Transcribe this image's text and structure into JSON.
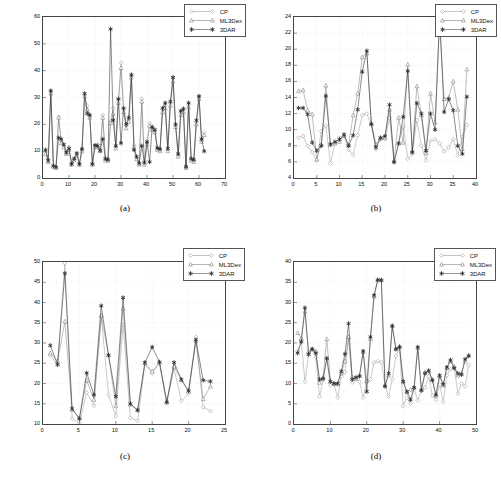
{
  "figure": {
    "panels": [
      {
        "id": "a",
        "caption": "(a)",
        "legend": [
          {
            "label": "CP",
            "marker": "diamond-open"
          },
          {
            "label": "ML3Dex",
            "marker": "triangle-open"
          },
          {
            "label": "3DAR",
            "marker": "star-filled"
          }
        ],
        "chart_data": {
          "type": "line",
          "title": "",
          "xlabel": "",
          "ylabel": "",
          "xlim": [
            0,
            70
          ],
          "ylim": [
            0,
            60
          ],
          "xticks": [
            0,
            10,
            20,
            30,
            40,
            50,
            60,
            70
          ],
          "yticks": [
            0,
            10,
            20,
            30,
            40,
            50,
            60
          ],
          "grid": true,
          "legend_position": "top-right",
          "x": [
            1,
            2,
            3,
            4,
            5,
            6,
            7,
            8,
            9,
            10,
            11,
            12,
            13,
            14,
            15,
            16,
            17,
            18,
            19,
            20,
            21,
            22,
            23,
            24,
            25,
            26,
            27,
            28,
            29,
            30,
            31,
            32,
            33,
            34,
            35,
            36,
            37,
            38,
            39,
            40,
            41,
            42,
            43,
            44,
            45,
            46,
            47,
            48,
            49,
            50,
            51,
            52,
            53,
            54,
            55,
            56,
            57,
            58,
            59,
            60,
            61,
            62
          ],
          "series": [
            {
              "name": "CP",
              "values": [
                9.5,
                7.0,
                32.5,
                4.5,
                4.0,
                22.8,
                14.0,
                12.0,
                9.5,
                11.5,
                5.5,
                7.0,
                9.0,
                5.5,
                10.5,
                31.2,
                27.0,
                23.0,
                5.5,
                12.0,
                12.5,
                10.5,
                23.5,
                7.0,
                7.0,
                21.0,
                26.0,
                11.5,
                29.2,
                43.0,
                25.8,
                19.5,
                22.0,
                38.2,
                12.2,
                7.5,
                5.5,
                29.5,
                5.5,
                13.0,
                20.5,
                18.5,
                17.5,
                11.0,
                10.5,
                25.5,
                27.0,
                10.5,
                28.0,
                37.2,
                19.5,
                8.5,
                24.5,
                25.5,
                4.0,
                27.5,
                7.0,
                6.5,
                21.0,
                30.2,
                14.0,
                17.0
              ]
            },
            {
              "name": "ML3Dex",
              "values": [
                9.0,
                6.0,
                31.5,
                4.2,
                3.8,
                22.5,
                13.0,
                11.5,
                9.0,
                10.5,
                5.0,
                6.5,
                8.5,
                5.0,
                10.0,
                30.5,
                25.5,
                22.5,
                5.0,
                11.5,
                11.5,
                10.0,
                22.5,
                6.5,
                6.5,
                20.5,
                24.0,
                11.0,
                28.0,
                41.0,
                24.5,
                18.5,
                21.0,
                37.5,
                11.5,
                7.0,
                5.0,
                28.5,
                5.0,
                12.5,
                19.5,
                18.0,
                17.0,
                10.5,
                10.0,
                24.5,
                26.0,
                10.0,
                27.0,
                36.0,
                19.0,
                8.0,
                23.5,
                24.5,
                3.8,
                26.5,
                6.5,
                6.0,
                20.0,
                29.5,
                13.5,
                16.0
              ]
            },
            {
              "name": "3DAR",
              "values": [
                10.5,
                6.5,
                32.5,
                4.5,
                4.0,
                15.0,
                14.5,
                12.5,
                9.5,
                11.0,
                5.2,
                7.2,
                9.2,
                5.2,
                10.8,
                31.5,
                24.0,
                23.5,
                5.2,
                12.2,
                12.0,
                10.2,
                14.5,
                7.2,
                6.8,
                55.5,
                21.5,
                12.0,
                29.5,
                13.0,
                26.0,
                20.0,
                22.5,
                38.5,
                10.5,
                8.0,
                5.5,
                12.0,
                5.8,
                13.5,
                6.0,
                19.0,
                18.0,
                11.2,
                10.8,
                26.0,
                28.0,
                11.0,
                28.5,
                37.5,
                20.0,
                9.0,
                25.0,
                25.8,
                4.2,
                28.0,
                7.2,
                6.8,
                21.5,
                30.5,
                14.5,
                10.0
              ]
            }
          ]
        }
      },
      {
        "id": "b",
        "caption": "(b)",
        "legend": [
          {
            "label": "CP",
            "marker": "diamond-open"
          },
          {
            "label": "ML3Dex",
            "marker": "triangle-open"
          },
          {
            "label": "3DAR",
            "marker": "star-filled"
          }
        ],
        "chart_data": {
          "type": "line",
          "title": "",
          "xlabel": "",
          "ylabel": "",
          "xlim": [
            0,
            40
          ],
          "ylim": [
            4,
            24
          ],
          "xticks": [
            0,
            5,
            10,
            15,
            20,
            25,
            30,
            35,
            40
          ],
          "yticks": [
            4,
            6,
            8,
            10,
            12,
            14,
            16,
            18,
            20,
            22,
            24
          ],
          "grid": true,
          "legend_position": "top-right",
          "x": [
            1,
            2,
            3,
            4,
            5,
            6,
            7,
            8,
            9,
            10,
            11,
            12,
            13,
            14,
            15,
            16,
            17,
            18,
            19,
            20,
            21,
            22,
            23,
            24,
            25,
            26,
            27,
            28,
            29,
            30,
            31,
            32,
            33,
            34,
            35,
            36,
            37,
            38
          ],
          "series": [
            {
              "name": "CP",
              "values": [
                9.0,
                9.2,
                8.0,
                7.2,
                6.2,
                9.8,
                10.5,
                5.8,
                8.3,
                9.0,
                9.2,
                7.5,
                6.9,
                9.3,
                11.8,
                12.0,
                10.6,
                7.6,
                8.8,
                8.8,
                11.5,
                5.9,
                8.3,
                10.4,
                6.4,
                7.0,
                11.2,
                8.0,
                6.2,
                8.6,
                8.8,
                8.3,
                7.3,
                7.8,
                8.8,
                6.8,
                9.1,
                10.6
              ]
            },
            {
              "name": "ML3Dex",
              "values": [
                14.8,
                14.9,
                12.4,
                11.9,
                6.3,
                8.2,
                15.5,
                8.1,
                8.3,
                8.5,
                9.3,
                8.1,
                11.8,
                14.5,
                19.0,
                19.5,
                10.8,
                8.2,
                8.9,
                9.0,
                12.5,
                6.1,
                11.5,
                8.4,
                18.1,
                7.3,
                15.4,
                11.8,
                7.1,
                14.5,
                10.9,
                23.5,
                13.8,
                14.0,
                16.0,
                12.5,
                7.6,
                17.5
              ]
            },
            {
              "name": "3DAR",
              "values": [
                12.7,
                12.7,
                11.9,
                8.4,
                7.4,
                8.0,
                14.2,
                8.2,
                8.5,
                8.8,
                9.4,
                8.0,
                9.3,
                12.5,
                17.2,
                19.8,
                10.7,
                7.8,
                9.0,
                9.2,
                13.1,
                6.0,
                8.3,
                11.6,
                17.3,
                7.2,
                13.3,
                12.0,
                7.4,
                12.0,
                10.0,
                24.0,
                12.2,
                13.8,
                12.4,
                8.0,
                7.0,
                14.1
              ]
            }
          ]
        }
      },
      {
        "id": "c",
        "caption": "(c)",
        "legend": [
          {
            "label": "CP",
            "marker": "diamond-open"
          },
          {
            "label": "ML3Dex",
            "marker": "triangle-open"
          },
          {
            "label": "3DAR",
            "marker": "star-filled"
          }
        ],
        "chart_data": {
          "type": "line",
          "title": "",
          "xlabel": "",
          "ylabel": "",
          "xlim": [
            0,
            25
          ],
          "ylim": [
            10,
            50
          ],
          "xticks": [
            0,
            5,
            10,
            15,
            20,
            25
          ],
          "yticks": [
            10,
            15,
            20,
            25,
            30,
            35,
            40,
            45,
            50
          ],
          "grid": true,
          "legend_position": "top-right",
          "x": [
            1,
            2,
            3,
            4,
            5,
            6,
            7,
            8,
            9,
            10,
            11,
            12,
            13,
            14,
            15,
            16,
            17,
            18,
            19,
            20,
            21,
            22,
            23
          ],
          "series": [
            {
              "name": "CP",
              "values": [
                27.0,
                24.5,
                49.7,
                11.3,
                10.2,
                17.8,
                14.5,
                36.5,
                17.2,
                12.0,
                34.5,
                11.5,
                10.8,
                24.8,
                22.5,
                25.0,
                15.2,
                23.8,
                15.7,
                17.5,
                31.5,
                14.2,
                13.2
              ]
            },
            {
              "name": "ML3Dex",
              "values": [
                27.5,
                25.5,
                35.3,
                13.5,
                11.5,
                20.8,
                16.0,
                36.8,
                27.0,
                14.5,
                38.5,
                14.8,
                13.5,
                25.0,
                23.0,
                25.2,
                15.4,
                24.2,
                20.8,
                18.0,
                30.5,
                16.2,
                19.3
              ]
            },
            {
              "name": "3DAR",
              "values": [
                29.4,
                24.7,
                47.2,
                13.8,
                11.3,
                22.6,
                17.2,
                39.2,
                27.0,
                16.8,
                41.2,
                15.0,
                13.4,
                25.2,
                29.0,
                25.3,
                15.4,
                25.2,
                21.0,
                18.2,
                30.8,
                20.8,
                20.5
              ]
            }
          ]
        }
      },
      {
        "id": "d",
        "caption": "(d)",
        "legend": [
          {
            "label": "CP",
            "marker": "diamond-open"
          },
          {
            "label": "ML3Dex",
            "marker": "triangle-open"
          },
          {
            "label": "3DAR",
            "marker": "star-filled"
          }
        ],
        "chart_data": {
          "type": "line",
          "title": "",
          "xlabel": "",
          "ylabel": "",
          "xlim": [
            0,
            50
          ],
          "ylim": [
            0,
            40
          ],
          "xticks": [
            0,
            10,
            20,
            30,
            40,
            50
          ],
          "yticks": [
            0,
            5,
            10,
            15,
            20,
            25,
            30,
            35,
            40
          ],
          "grid": true,
          "legend_position": "top-right",
          "x": [
            1,
            2,
            3,
            4,
            5,
            6,
            7,
            8,
            9,
            10,
            11,
            12,
            13,
            14,
            15,
            16,
            17,
            18,
            19,
            20,
            21,
            22,
            23,
            24,
            25,
            26,
            27,
            28,
            29,
            30,
            31,
            32,
            33,
            34,
            35,
            36,
            37,
            38,
            39,
            40,
            41,
            42,
            43,
            44,
            45,
            46,
            47,
            48
          ],
          "series": [
            {
              "name": "CP",
              "values": [
                18.0,
                20.5,
                10.5,
                17.0,
                18.5,
                16.5,
                6.8,
                10.8,
                16.2,
                9.5,
                9.8,
                6.5,
                11.8,
                12.8,
                21.2,
                10.2,
                11.2,
                10.5,
                6.5,
                10.5,
                11.0,
                15.2,
                15.5,
                15.3,
                9.5,
                6.8,
                11.0,
                16.8,
                18.8,
                4.5,
                6.5,
                5.0,
                8.8,
                5.8,
                8.2,
                9.0,
                11.8,
                7.0,
                6.0,
                9.8,
                5.5,
                12.0,
                13.5,
                14.0,
                7.5,
                10.0,
                9.3,
                14.5
              ]
            },
            {
              "name": "ML3Dex",
              "values": [
                22.5,
                21.2,
                27.8,
                17.8,
                18.5,
                18.0,
                10.2,
                11.5,
                21.0,
                10.5,
                10.0,
                9.8,
                12.5,
                15.5,
                21.5,
                11.5,
                11.2,
                12.0,
                17.8,
                10.6,
                21.0,
                31.5,
                35.5,
                35.6,
                9.5,
                12.0,
                24.3,
                18.5,
                19.2,
                10.5,
                7.8,
                8.5,
                9.0,
                18.8,
                8.5,
                12.8,
                13.0,
                11.0,
                7.0,
                11.8,
                9.5,
                13.8,
                15.5,
                14.2,
                12.0,
                12.5,
                15.5,
                17.0
              ]
            },
            {
              "name": "3DAR",
              "values": [
                17.5,
                20.3,
                28.7,
                17.2,
                18.5,
                17.5,
                11.0,
                11.2,
                16.2,
                10.5,
                10.0,
                10.0,
                13.0,
                17.3,
                24.8,
                11.0,
                11.5,
                11.8,
                18.0,
                8.0,
                21.5,
                31.8,
                35.6,
                35.5,
                9.3,
                12.5,
                24.2,
                18.5,
                19.0,
                10.5,
                8.0,
                6.0,
                9.0,
                19.0,
                8.3,
                12.5,
                13.2,
                10.8,
                7.2,
                12.0,
                9.8,
                14.0,
                15.8,
                13.8,
                12.5,
                12.2,
                16.0,
                16.8
              ]
            }
          ]
        }
      }
    ]
  }
}
